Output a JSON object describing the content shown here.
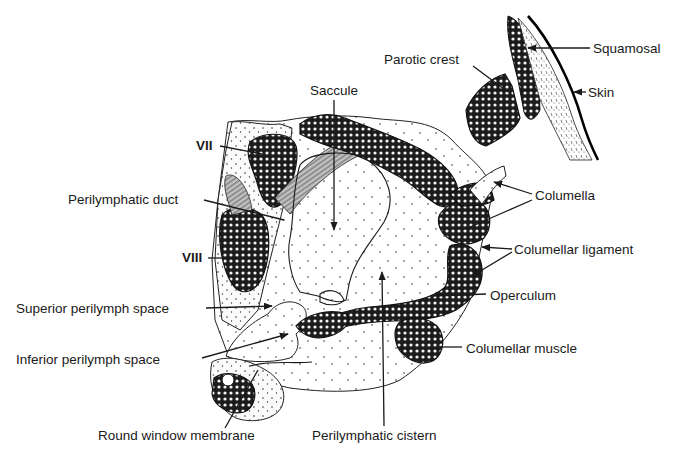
{
  "figure": {
    "labels": {
      "saccule": "Saccule",
      "parotic_crest": "Parotic crest",
      "squamosal": "Squamosal",
      "skin": "Skin",
      "vii": "VII",
      "perilymphatic_duct": "Perilymphatic duct",
      "columella": "Columella",
      "viii": "VIII",
      "columellar_ligament": "Columellar ligament",
      "operculum": "Operculum",
      "superior_perilymph_space": "Superior perilymph space",
      "inferior_perilymph_space": "Inferior perilymph space",
      "columellar_muscle": "Columellar muscle",
      "round_window_membrane": "Round window membrane",
      "perilymphatic_cistern": "Perilymphatic cistern"
    }
  },
  "colors": {
    "ink": "#1a1a1a",
    "paper": "#ffffff"
  }
}
